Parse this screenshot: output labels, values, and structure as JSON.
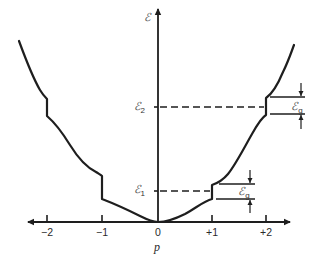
{
  "diagram": {
    "x_axis": {
      "label": "p",
      "ticks": [
        {
          "value": -2,
          "label": "−2"
        },
        {
          "value": -1,
          "label": "−1"
        },
        {
          "value": 0,
          "label": "0"
        },
        {
          "value": 1,
          "label": "+1"
        },
        {
          "value": 2,
          "label": "+2"
        }
      ]
    },
    "y_axis": {
      "label": "ℰ",
      "levels": [
        {
          "name": "E1",
          "symbol": "ℰ",
          "subscript": "1"
        },
        {
          "name": "E2",
          "symbol": "ℰ",
          "subscript": "2"
        }
      ]
    },
    "gap_label": {
      "symbol": "ℰ",
      "subscript": "g"
    },
    "curve": {
      "description": "Parabola-like dispersion with discontinuous energy gaps at p = ±1 and p = ±2",
      "gaps_at_p": [
        -2,
        -1,
        1,
        2
      ]
    }
  }
}
